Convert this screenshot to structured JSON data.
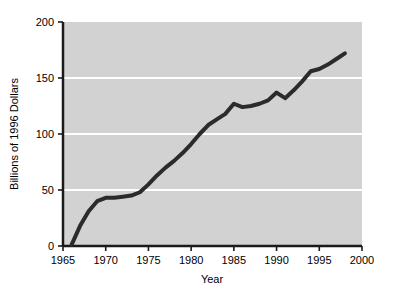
{
  "chart_data": {
    "type": "line",
    "title": "",
    "xlabel": "Year",
    "ylabel": "Billions of 1996 Dollars",
    "xlim": [
      1965,
      2000
    ],
    "ylim": [
      0,
      200
    ],
    "xticks": [
      1965,
      1970,
      1975,
      1980,
      1985,
      1990,
      1995,
      2000
    ],
    "xticklabels": [
      "1965",
      "1970",
      "1975",
      "1980",
      "1985",
      "1990",
      "1995",
      "2000"
    ],
    "yticks": [
      0,
      50,
      100,
      150,
      200
    ],
    "yticklabels": [
      "0",
      "50",
      "100",
      "150",
      "200"
    ],
    "gridlines": {
      "horizontal": [
        50,
        100,
        150
      ],
      "vertical": [],
      "color": "#ffffff"
    },
    "plot_background": "#d2d2d2",
    "line_color": "#2b2b2b",
    "line_width": 4,
    "legend": null,
    "series": [
      {
        "name": "Real outlays",
        "x": [
          1966,
          1967,
          1968,
          1969,
          1970,
          1971,
          1972,
          1973,
          1974,
          1975,
          1976,
          1977,
          1978,
          1979,
          1980,
          1981,
          1982,
          1983,
          1984,
          1985,
          1986,
          1987,
          1988,
          1989,
          1990,
          1991,
          1992,
          1993,
          1994,
          1995,
          1996,
          1997,
          1998
        ],
        "values": [
          1,
          18,
          31,
          40,
          43,
          43,
          44,
          45,
          48,
          55,
          63,
          70,
          76,
          83,
          91,
          100,
          108,
          113,
          118,
          127,
          124,
          125,
          127,
          130,
          137,
          132,
          139,
          147,
          156,
          158,
          162,
          167,
          172
        ]
      }
    ]
  },
  "axes": {
    "x_axis_name": "year-axis",
    "y_axis_name": "dollars-axis"
  }
}
